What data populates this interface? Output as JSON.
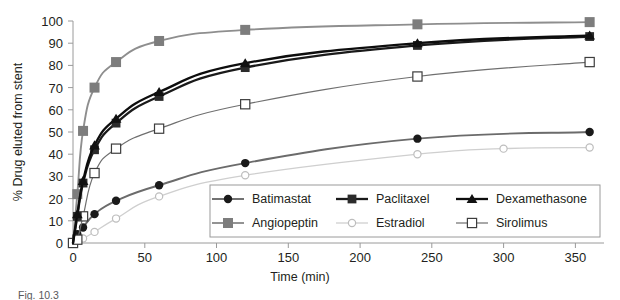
{
  "chart_data": {
    "type": "line",
    "title": "",
    "xlabel": "Time (min)",
    "ylabel": "% Drug eluted from stent",
    "xlim": [
      0,
      370
    ],
    "ylim": [
      0,
      100
    ],
    "xticks": [
      0,
      50,
      100,
      150,
      200,
      250,
      300,
      350
    ],
    "yticks": [
      0,
      10,
      20,
      30,
      40,
      50,
      60,
      70,
      80,
      90,
      100
    ],
    "grid": false,
    "legend_position": "inside-bottom-right",
    "series": [
      {
        "name": "Batimastat",
        "marker": "filled-circle",
        "color": "#404040",
        "x": [
          0,
          3,
          7,
          15,
          30,
          60,
          120,
          240,
          360
        ],
        "y": [
          0,
          4,
          7,
          13,
          19,
          26,
          36,
          47,
          50
        ]
      },
      {
        "name": "Paclitaxel",
        "marker": "filled-square",
        "color": "#1a1a1a",
        "x": [
          0,
          3,
          7,
          15,
          30,
          60,
          120,
          240,
          360
        ],
        "y": [
          0,
          12,
          27,
          42,
          54,
          66,
          79,
          89,
          93
        ]
      },
      {
        "name": "Dexamethasone",
        "marker": "filled-triangle",
        "color": "#111111",
        "x": [
          0,
          3,
          7,
          15,
          30,
          60,
          120,
          240,
          360
        ],
        "y": [
          0,
          13,
          28,
          44,
          56,
          68,
          81,
          90,
          93.5
        ]
      },
      {
        "name": "Angiopeptin",
        "marker": "filled-square-gray",
        "color": "#7d7d7d",
        "x": [
          0,
          3,
          7,
          15,
          30,
          60,
          120,
          240,
          360
        ],
        "y": [
          0,
          22,
          50.5,
          70,
          81.5,
          91,
          96,
          98.5,
          99.5
        ]
      },
      {
        "name": "Estradiol",
        "marker": "open-circle",
        "color": "#c7c7c7",
        "x": [
          0,
          3,
          7,
          15,
          30,
          60,
          120,
          240,
          300,
          360
        ],
        "y": [
          0,
          1,
          2,
          5,
          11,
          21,
          30.5,
          40,
          42.5,
          43
        ]
      },
      {
        "name": "Sirolimus",
        "marker": "open-square",
        "color": "#5a5a5a",
        "x": [
          0,
          3,
          7,
          15,
          30,
          60,
          120,
          240,
          360
        ],
        "y": [
          0,
          1.5,
          12,
          31.5,
          42.5,
          51.5,
          62.5,
          75,
          81.5
        ]
      }
    ]
  },
  "axis": {
    "ylabel": "% Drug eluted from stent",
    "xlabel": "Time (min)",
    "yticks": [
      "100",
      "90",
      "80",
      "70",
      "60",
      "50",
      "40",
      "30",
      "20",
      "10",
      "0"
    ],
    "xticks": [
      "0",
      "50",
      "100",
      "150",
      "200",
      "250",
      "300",
      "350"
    ]
  },
  "legend": {
    "entries": [
      {
        "label": "Batimastat",
        "marker": "filled-circle",
        "color": "#2b2b2b"
      },
      {
        "label": "Paclitaxel",
        "marker": "filled-square",
        "color": "#2b2b2b"
      },
      {
        "label": "Dexamethasone",
        "marker": "filled-triangle",
        "color": "#1a1a1a"
      },
      {
        "label": "Angiopeptin",
        "marker": "filled-square-gray",
        "color": "#7d7d7d"
      },
      {
        "label": "Estradiol",
        "marker": "open-circle",
        "color": "#c7c7c7"
      },
      {
        "label": "Sirolimus",
        "marker": "open-square",
        "color": "#5a5a5a"
      }
    ]
  },
  "caption": {
    "text": "Fig. 10.3"
  }
}
